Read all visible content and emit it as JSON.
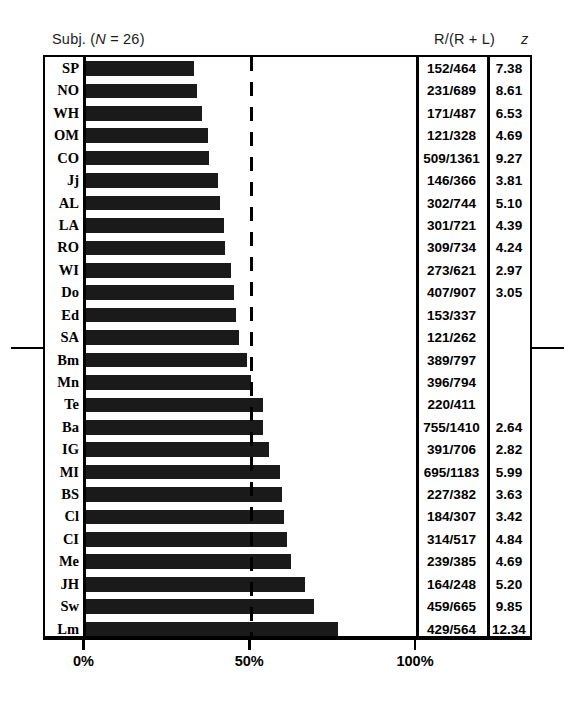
{
  "header": {
    "subject_label": "Subj. (",
    "subject_n_italic": "N",
    "subject_n_rest": " = 26)",
    "subject_full": "Subj. (N = 26)",
    "ratio_label": "R/(R + L)",
    "z_label": "z"
  },
  "axis": {
    "ticks": [
      "0%",
      "50%",
      "100%"
    ],
    "tick_values": [
      0,
      50,
      100
    ]
  },
  "chart_data": {
    "type": "bar",
    "title": "",
    "subtitle": "",
    "xlabel": "",
    "ylabel": "Subj. (N = 26)",
    "orientation": "horizontal",
    "xlim": [
      0,
      100
    ],
    "xtick_labels": [
      "0%",
      "50%",
      "100%"
    ],
    "xticks": [
      0,
      50,
      100
    ],
    "grid": false,
    "legend": "none",
    "reference_line": {
      "value": 50,
      "style": "dashed",
      "label": "50%"
    },
    "median_marker_after_row": 13,
    "bar_color": "#1a1a1a",
    "categories": [
      "SP",
      "NO",
      "WH",
      "OM",
      "CO",
      "Jj",
      "AL",
      "LA",
      "RO",
      "WI",
      "Do",
      "Ed",
      "SA",
      "Bm",
      "Mn",
      "Te",
      "Ba",
      "IG",
      "MI",
      "BS",
      "Cl",
      "CI",
      "Me",
      "JH",
      "Sw",
      "Lm"
    ],
    "values": [
      32.8,
      33.5,
      35.1,
      36.9,
      37.4,
      39.9,
      40.6,
      41.7,
      42.1,
      44.0,
      44.9,
      45.4,
      46.2,
      48.8,
      49.9,
      53.5,
      53.5,
      55.4,
      58.7,
      59.4,
      59.9,
      60.7,
      62.1,
      66.1,
      69.0,
      76.1
    ],
    "series": [
      {
        "name": "R/(R + L)",
        "values": [
          32.8,
          33.5,
          35.1,
          36.9,
          37.4,
          39.9,
          40.6,
          41.7,
          42.1,
          44.0,
          44.9,
          45.4,
          46.2,
          48.8,
          49.9,
          53.5,
          53.5,
          55.4,
          58.7,
          59.4,
          59.9,
          60.7,
          62.1,
          66.1,
          69.0,
          76.1
        ]
      }
    ],
    "table_columns": [
      "Subj.",
      "R/(R + L)",
      "z"
    ],
    "rows": [
      {
        "subject": "SP",
        "ratio": "152/464",
        "z": "7.38",
        "pct": 32.8
      },
      {
        "subject": "NO",
        "ratio": "231/689",
        "z": "8.61",
        "pct": 33.5
      },
      {
        "subject": "WH",
        "ratio": "171/487",
        "z": "6.53",
        "pct": 35.1
      },
      {
        "subject": "OM",
        "ratio": "121/328",
        "z": "4.69",
        "pct": 36.9
      },
      {
        "subject": "CO",
        "ratio": "509/1361",
        "z": "9.27",
        "pct": 37.4
      },
      {
        "subject": "Jj",
        "ratio": "146/366",
        "z": "3.81",
        "pct": 39.9
      },
      {
        "subject": "AL",
        "ratio": "302/744",
        "z": "5.10",
        "pct": 40.6
      },
      {
        "subject": "LA",
        "ratio": "301/721",
        "z": "4.39",
        "pct": 41.7
      },
      {
        "subject": "RO",
        "ratio": "309/734",
        "z": "4.24",
        "pct": 42.1
      },
      {
        "subject": "WI",
        "ratio": "273/621",
        "z": "2.97",
        "pct": 44.0
      },
      {
        "subject": "Do",
        "ratio": "407/907",
        "z": "3.05",
        "pct": 44.9
      },
      {
        "subject": "Ed",
        "ratio": "153/337",
        "z": "",
        "pct": 45.4
      },
      {
        "subject": "SA",
        "ratio": "121/262",
        "z": "",
        "pct": 46.2
      },
      {
        "subject": "Bm",
        "ratio": "389/797",
        "z": "",
        "pct": 48.8
      },
      {
        "subject": "Mn",
        "ratio": "396/794",
        "z": "",
        "pct": 49.9
      },
      {
        "subject": "Te",
        "ratio": "220/411",
        "z": "",
        "pct": 53.5
      },
      {
        "subject": "Ba",
        "ratio": "755/1410",
        "z": "2.64",
        "pct": 53.5
      },
      {
        "subject": "IG",
        "ratio": "391/706",
        "z": "2.82",
        "pct": 55.4
      },
      {
        "subject": "MI",
        "ratio": "695/1183",
        "z": "5.99",
        "pct": 58.7
      },
      {
        "subject": "BS",
        "ratio": "227/382",
        "z": "3.63",
        "pct": 59.4
      },
      {
        "subject": "Cl",
        "ratio": "184/307",
        "z": "3.42",
        "pct": 59.9
      },
      {
        "subject": "CI",
        "ratio": "314/517",
        "z": "4.84",
        "pct": 60.7
      },
      {
        "subject": "Me",
        "ratio": "239/385",
        "z": "4.69",
        "pct": 62.1
      },
      {
        "subject": "JH",
        "ratio": "164/248",
        "z": "5.20",
        "pct": 66.1
      },
      {
        "subject": "Sw",
        "ratio": "459/665",
        "z": "9.85",
        "pct": 69.0
      },
      {
        "subject": "Lm",
        "ratio": "429/564",
        "z": "12.34",
        "pct": 76.1
      }
    ]
  }
}
